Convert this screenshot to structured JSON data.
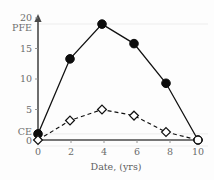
{
  "chart_data": {
    "type": "line",
    "title": "",
    "subtitle": "",
    "xlabel": "Date, (yrs)",
    "ylabel": "",
    "x": [
      0,
      2,
      4,
      6,
      8,
      10
    ],
    "xticklabels": [
      "0",
      "2",
      "4",
      "6",
      "8",
      "10"
    ],
    "xlim": [
      0,
      10
    ],
    "ylim": [
      0,
      20
    ],
    "yticks": [
      0,
      5,
      10,
      15,
      20
    ],
    "yticklabels": [
      "0",
      "5",
      "10",
      "15",
      "20"
    ],
    "banded_labels": [
      {
        "label": "PFE",
        "value": 19
      },
      {
        "label": "CE",
        "value": 1
      }
    ],
    "grid": "horizontal-faint",
    "gridlines": [
      19,
      1
    ],
    "legend": "none",
    "legend_position": "none",
    "series": [
      {
        "name": "PFE",
        "marker": "filled-circle",
        "linestyle": "solid",
        "color": "#111111",
        "values": [
          1,
          13.3,
          19,
          15.8,
          9.3,
          0
        ]
      },
      {
        "name": "CE",
        "marker": "open-diamond",
        "linestyle": "dashed",
        "color": "#111111",
        "values": [
          0,
          3.2,
          5,
          4,
          1.3,
          0
        ]
      }
    ],
    "annotations": [
      {
        "text": "20",
        "role": "y-axis-top-label"
      },
      {
        "text": "PFE",
        "role": "y-axis-band-label"
      },
      {
        "text": "CE",
        "role": "y-axis-band-label"
      },
      {
        "text": "0",
        "role": "y-axis-origin-label"
      }
    ],
    "axis_arrow": "y-axis-upward-arrow"
  },
  "colors": {
    "axis": "#4a4a4a",
    "grid": "#ededed",
    "series_ink": "#111111",
    "tick_text": "#6b6b6b",
    "background": "#fdfdfd"
  }
}
